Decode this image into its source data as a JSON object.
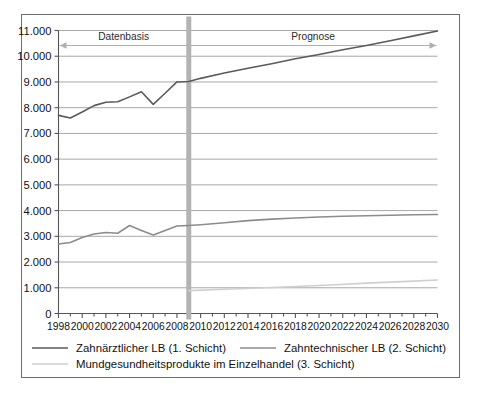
{
  "chart_data": {
    "type": "line",
    "title": "",
    "subtitle": "",
    "xlabel": "",
    "ylabel": "",
    "xlim": [
      1998,
      2030
    ],
    "ylim": [
      0,
      11000
    ],
    "grid": true,
    "legend_position": "bottom",
    "ytick_labels": [
      "11.000",
      "10.000",
      "9.000",
      "8.000",
      "7.000",
      "6.000",
      "5.000",
      "4.000",
      "3.000",
      "2.000",
      "1.000",
      "0"
    ],
    "ytick_values": [
      11000,
      10000,
      9000,
      8000,
      7000,
      6000,
      5000,
      4000,
      3000,
      2000,
      1000,
      0
    ],
    "xtick_labels": [
      "1998",
      "2000",
      "2002",
      "2004",
      "2006",
      "2008",
      "2010",
      "2012",
      "2014",
      "2016",
      "2018",
      "2020",
      "2022",
      "2024",
      "2026",
      "2028",
      "2030"
    ],
    "xtick_values": [
      1998,
      2000,
      2002,
      2004,
      2006,
      2008,
      2010,
      2012,
      2014,
      2016,
      2018,
      2020,
      2022,
      2024,
      2026,
      2028,
      2030
    ],
    "x_minor_step": 1,
    "annotations": [
      {
        "name": "datenbasis",
        "label": "Datenbasis",
        "range": [
          1998,
          2009
        ],
        "arrow": "left"
      },
      {
        "name": "prognose",
        "label": "Prognose",
        "range": [
          2009,
          2030
        ],
        "arrow": "right"
      }
    ],
    "divider": {
      "x": 2009,
      "color": "#b3b3b3",
      "width_px": 5
    },
    "series": [
      {
        "name": "Zahnärztlicher LB (1. Schicht)",
        "color": "#5a5a5a",
        "width_px": 1.6,
        "x": [
          1998,
          1999,
          2000,
          2001,
          2002,
          2003,
          2004,
          2005,
          2006,
          2007,
          2008,
          2009,
          2010,
          2012,
          2014,
          2016,
          2018,
          2020,
          2022,
          2024,
          2026,
          2028,
          2030
        ],
        "values": [
          7700,
          7600,
          7830,
          8080,
          8210,
          8230,
          8420,
          8620,
          8130,
          8560,
          9000,
          9020,
          9140,
          9350,
          9530,
          9710,
          9900,
          10070,
          10250,
          10420,
          10600,
          10790,
          10980
        ]
      },
      {
        "name": "Zahntechnischer LB (2. Schicht)",
        "color": "#8c8c8c",
        "width_px": 1.6,
        "x": [
          1998,
          1999,
          2000,
          2001,
          2002,
          2003,
          2004,
          2005,
          2006,
          2007,
          2008,
          2009,
          2010,
          2012,
          2014,
          2016,
          2018,
          2020,
          2022,
          2024,
          2026,
          2028,
          2030
        ],
        "values": [
          2700,
          2760,
          2950,
          3090,
          3150,
          3120,
          3420,
          3230,
          3050,
          3230,
          3400,
          3420,
          3450,
          3530,
          3610,
          3670,
          3710,
          3750,
          3780,
          3800,
          3820,
          3840,
          3850
        ]
      },
      {
        "name": "Mundgesundheitsprodukte im Einzelhandel (3. Schicht)",
        "color": "#cfcfcf",
        "width_px": 1.6,
        "x": [
          2009,
          2012,
          2015,
          2018,
          2021,
          2024,
          2027,
          2030
        ],
        "values": [
          890,
          940,
          990,
          1050,
          1110,
          1180,
          1240,
          1300
        ]
      }
    ]
  },
  "legend": {
    "items": [
      {
        "label": "Zahnärztlicher LB (1. Schicht)",
        "color": "#5a5a5a"
      },
      {
        "label": "Zahntechnischer LB (2. Schicht)",
        "color": "#8c8c8c"
      },
      {
        "label": "Mundgesundheitsprodukte im Einzelhandel (3. Schicht)",
        "color": "#cfcfcf"
      }
    ]
  }
}
